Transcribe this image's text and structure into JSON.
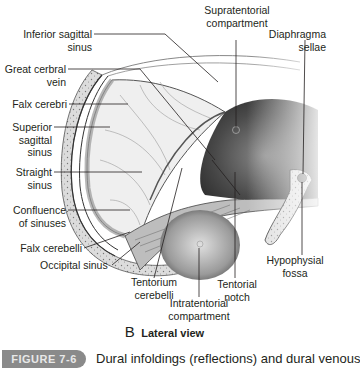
{
  "figure": {
    "view_letter": "B",
    "view_title": "Lateral view",
    "figure_badge": "FIGURE 7-6",
    "caption": "Dural infoldings (reflections) and dural venous"
  },
  "labels": {
    "inferior_sagittal_sinus": [
      "Inferior sagittal",
      "sinus"
    ],
    "great_cerebral_vein": [
      "Great cerbral",
      "vein"
    ],
    "falx_cerebri": [
      "Falx cerebri"
    ],
    "superior_sagittal_sinus": [
      "Superior",
      "sagittal",
      "sinus"
    ],
    "straight_sinus": [
      "Straight",
      "sinus"
    ],
    "confluence_of_sinuses": [
      "Confluence",
      "of sinuses"
    ],
    "falx_cerebelli": [
      "Falx cerebelli"
    ],
    "occipital_sinus": [
      "Occipital sinus"
    ],
    "tentorium_cerebelli": [
      "Tentorium",
      "cerebelli"
    ],
    "intratentorial_compartment": [
      "Intratentorial",
      "compartment"
    ],
    "tentorial_notch": [
      "Tentorial",
      "notch"
    ],
    "hypophysial_fossa": [
      "Hypophysial",
      "fossa"
    ],
    "supratentorial_compartment": [
      "Supratentorial",
      "compartment"
    ],
    "diaphragma_sellae": [
      "Diaphragma",
      "sellae"
    ]
  },
  "colors": {
    "bone": "#d9d9d9",
    "dura_dark": "#3a3a3a",
    "leader": "#231f20",
    "badge": "#8a8a8a"
  }
}
